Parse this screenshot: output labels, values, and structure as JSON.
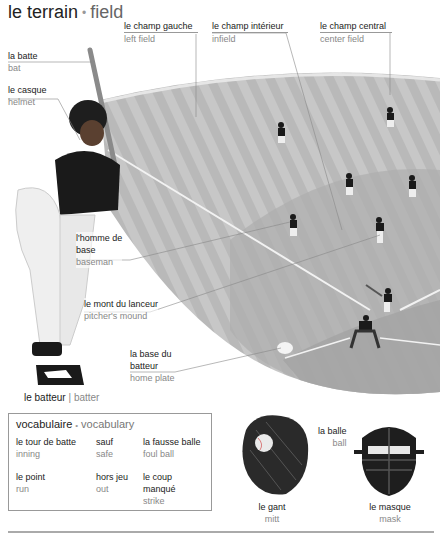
{
  "header": {
    "title_fr": "le terrain",
    "title_sep": "•",
    "title_en": "field"
  },
  "labels": {
    "left_field": {
      "fr": "le champ gauche",
      "en": "left field"
    },
    "infield": {
      "fr": "le champ intérieur",
      "en": "infield"
    },
    "center_field": {
      "fr": "le champ central",
      "en": "center field"
    },
    "bat": {
      "fr": "la batte",
      "en": "bat"
    },
    "helmet": {
      "fr": "le casque",
      "en": "helmet"
    },
    "baseman": {
      "fr1": "l'homme de",
      "fr2": "base",
      "en": "baseman"
    },
    "pitchers_mound": {
      "fr": "le mont du lanceur",
      "en": "pitcher's mound"
    },
    "home_plate": {
      "fr1": "la base du",
      "fr2": "batteur",
      "en": "home plate"
    },
    "batter": {
      "fr": "le batteur",
      "sep": "|",
      "en": "batter"
    },
    "ball": {
      "fr": "la balle",
      "en": "ball"
    },
    "mitt": {
      "fr": "le gant",
      "en": "mitt"
    },
    "mask": {
      "fr": "le masque",
      "en": "mask"
    }
  },
  "vocabulary": {
    "title_fr": "vocabulaire",
    "title_sep": "•",
    "title_en": "vocabulary",
    "items": [
      {
        "fr": "le tour de batte",
        "en": "inning"
      },
      {
        "fr": "sauf",
        "en": "safe"
      },
      {
        "fr": "la fausse balle",
        "en": "foul ball"
      },
      {
        "fr": "le point",
        "en": "run"
      },
      {
        "fr": "hors jeu",
        "en": "out"
      },
      {
        "fr1": "le coup",
        "fr2": "manqué",
        "en": "strike"
      }
    ]
  },
  "colors": {
    "field_gray": "#b8b8b8",
    "field_stripe": "#c6c6c6",
    "infield_dirt": "#a8a8a8",
    "line_white": "#f2f2f2",
    "leader_line": "#888888"
  }
}
